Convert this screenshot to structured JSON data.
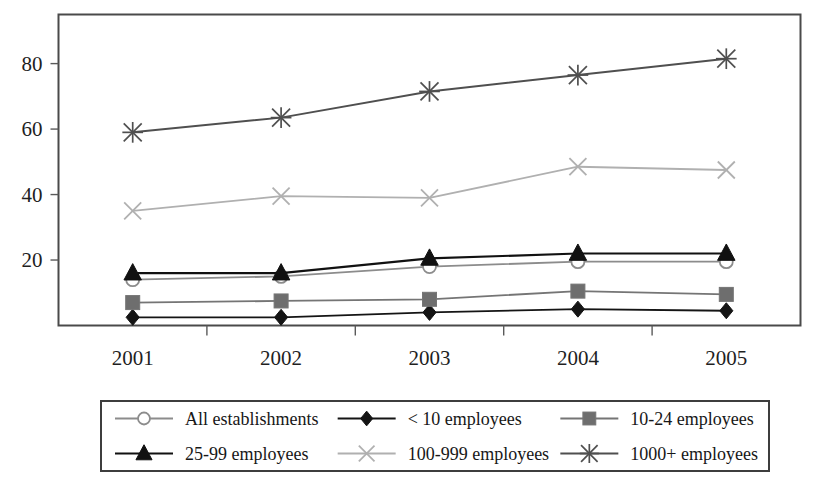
{
  "chart_data": {
    "type": "line",
    "title": "",
    "subtitle": "",
    "xlabel": "",
    "ylabel": "",
    "categories": [
      "2001",
      "2002",
      "2003",
      "2004",
      "2005"
    ],
    "ylim": [
      0,
      95
    ],
    "yticks": [
      20,
      40,
      60,
      80
    ],
    "ytick_labels": [
      "20",
      "40",
      "60",
      "80"
    ],
    "grid": false,
    "legend_position": "bottom",
    "legend_columns": 3,
    "series": [
      {
        "name": "All establishments",
        "values": [
          14,
          15,
          18,
          19.5,
          19.5
        ],
        "marker": "circle-open",
        "color": "#8c8c8c",
        "marker_fill": "#ffffff",
        "line_width": 1.8
      },
      {
        "name": "< 10 employees",
        "values": [
          2.5,
          2.5,
          4,
          5,
          4.5
        ],
        "marker": "diamond",
        "color": "#141414",
        "marker_fill": "#141414",
        "line_width": 1.8
      },
      {
        "name": "10-24 employees",
        "values": [
          7,
          7.5,
          8,
          10.5,
          9.5
        ],
        "marker": "square",
        "color": "#757575",
        "marker_fill": "#6e6e6e",
        "line_width": 1.8
      },
      {
        "name": "25-99 employees",
        "values": [
          16,
          16,
          20.5,
          22,
          22
        ],
        "marker": "triangle",
        "color": "#111111",
        "marker_fill": "#111111",
        "line_width": 2.2
      },
      {
        "name": "100-999 employees",
        "values": [
          35,
          39.5,
          39,
          48.5,
          47.5
        ],
        "marker": "cross",
        "color": "#b0b0b0",
        "marker_fill": "#b0b0b0",
        "line_width": 1.8
      },
      {
        "name": "1000+ employees",
        "values": [
          59,
          63.5,
          71.5,
          76.5,
          81.5
        ],
        "marker": "asterisk",
        "color": "#4f4f4f",
        "marker_fill": "#4f4f4f",
        "line_width": 2.0
      }
    ],
    "colors": {
      "frame": "#4a4a4a",
      "text": "#1f1f1f",
      "legend_border": "#3d3d3d",
      "background": "#ffffff"
    }
  }
}
